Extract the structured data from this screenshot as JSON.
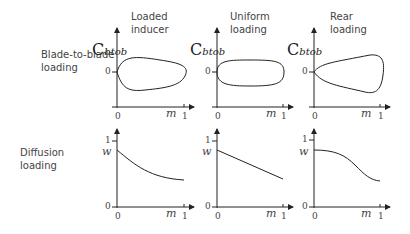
{
  "columns": [
    {
      "title_line1": "Loaded",
      "title_line2": "inducer"
    },
    {
      "title_line1": "Uniform",
      "title_line2": "loading"
    },
    {
      "title_line1": "Rear",
      "title_line2": "loading"
    }
  ],
  "rows": [
    {
      "label_line1": "Blade-to-blade",
      "label_line2": "loading"
    },
    {
      "label_line1": "Diffusion",
      "label_line2": "loading"
    }
  ],
  "axes": {
    "top_ylabel_main": "C",
    "top_ylabel_sub": "btob",
    "bottom_ylabel": "w",
    "xlabel": "m",
    "tick_zero": "0",
    "tick_one": "1"
  }
}
